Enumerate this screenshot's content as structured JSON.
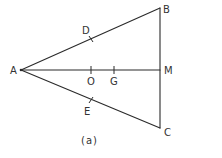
{
  "diagram": {
    "caption": "(a)",
    "points": {
      "A": {
        "label": "A",
        "x": 21,
        "y": 70
      },
      "B": {
        "label": "B",
        "x": 160,
        "y": 8
      },
      "C": {
        "label": "C",
        "x": 160,
        "y": 128
      },
      "M": {
        "label": "M",
        "x": 160,
        "y": 70
      },
      "D": {
        "label": "D",
        "x": 91,
        "y": 39
      },
      "E": {
        "label": "E",
        "x": 91,
        "y": 100
      },
      "O": {
        "label": "O",
        "x": 91,
        "y": 70
      },
      "G": {
        "label": "G",
        "x": 114,
        "y": 70
      }
    },
    "segments": [
      [
        "A",
        "B"
      ],
      [
        "A",
        "C"
      ],
      [
        "B",
        "C"
      ],
      [
        "A",
        "M"
      ]
    ],
    "tick_marks": [
      "D",
      "E",
      "O",
      "G"
    ]
  }
}
